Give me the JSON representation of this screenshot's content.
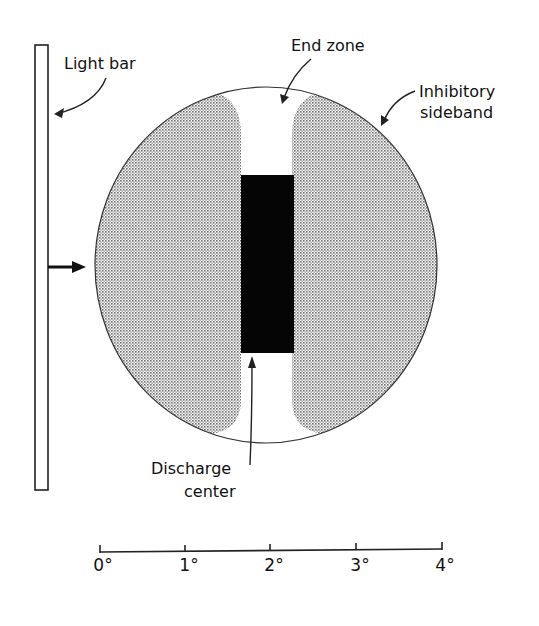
{
  "labels": {
    "light_bar": "Light bar",
    "end_zone": "End zone",
    "inhibitory_line1": "Inhibitory",
    "inhibitory_line2": "sideband",
    "discharge_line1": "Discharge",
    "discharge_line2": "center"
  },
  "scale": {
    "ticks": [
      "0°",
      "1°",
      "2°",
      "3°",
      "4°"
    ]
  },
  "colors": {
    "ink": "#111111",
    "stipple": "#9a9a9a",
    "background": "#ffffff"
  }
}
